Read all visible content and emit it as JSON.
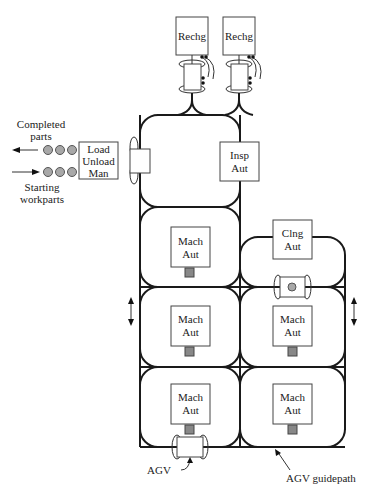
{
  "diagram": {
    "stations": {
      "recharge_1": {
        "label": "Rechg"
      },
      "recharge_2": {
        "label": "Rechg"
      },
      "load_unload": {
        "line1": "Load",
        "line2": "Unload",
        "line3": "Man"
      },
      "inspection": {
        "line1": "Insp",
        "line2": "Aut"
      },
      "cleaning": {
        "line1": "Clng",
        "line2": "Aut"
      },
      "machines": [
        {
          "line1": "Mach",
          "line2": "Aut"
        },
        {
          "line1": "Mach",
          "line2": "Aut"
        },
        {
          "line1": "Mach",
          "line2": "Aut"
        },
        {
          "line1": "Mach",
          "line2": "Aut"
        },
        {
          "line1": "Mach",
          "line2": "Aut"
        }
      ]
    },
    "flows": {
      "completed": {
        "line1": "Completed",
        "line2": "parts"
      },
      "starting": {
        "line1": "Starting",
        "line2": "workparts"
      }
    },
    "callouts": {
      "agv": "AGV",
      "guidepath": "AGV guidepath"
    },
    "colors": {
      "line": "#1a1a1a",
      "part": "#a8a8a8",
      "background": "#ffffff"
    }
  }
}
